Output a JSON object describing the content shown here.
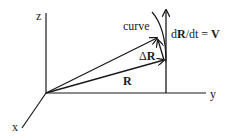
{
  "diagram": {
    "axes": {
      "z_label": "z",
      "y_label": "y",
      "x_label": "x"
    },
    "vectors": {
      "R_label": "R",
      "delta_R_prefix": "Δ",
      "delta_R_bold": "R"
    },
    "curve_label": "curve",
    "velocity": {
      "prefix": "d",
      "bold_R": "R",
      "middle": "/dt = ",
      "bold_V": "V"
    },
    "colors": {
      "ink": "#1a1a1a",
      "background": "#ffffff"
    }
  }
}
